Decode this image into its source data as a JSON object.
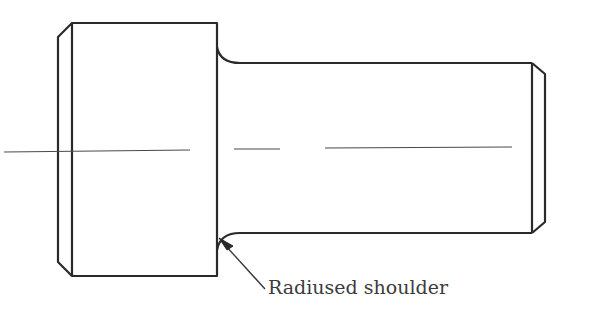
{
  "figure": {
    "type": "engineering drawing",
    "annotation": {
      "label": "Radiused shoulder",
      "arrow_target": "fillet between head and shank (lower)"
    },
    "colors": {
      "line": "#2a2a2a",
      "centerline": "#4a4a4a",
      "text": "#3c3c3c",
      "background": "#ffffff"
    },
    "features": [
      "chamfered head (left)",
      "radiused shoulder fillets",
      "shank",
      "chamfered end (right)",
      "dashed centerline"
    ]
  }
}
